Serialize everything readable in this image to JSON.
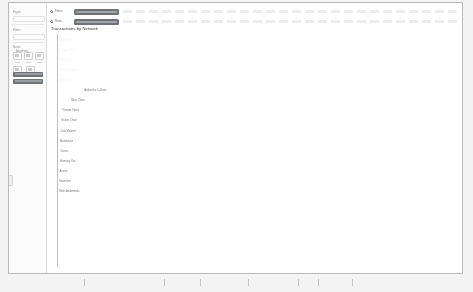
{
  "window": {
    "title": ""
  },
  "sidebar": {
    "section_labels": [
      {
        "text": "Pages",
        "x": 4,
        "y": 8
      },
      {
        "text": "Filters",
        "x": 4,
        "y": 26
      },
      {
        "text": "Marks",
        "x": 4,
        "y": 43
      }
    ],
    "field_label": "Automatic",
    "icon_buttons": [
      {
        "caption": "Color"
      },
      {
        "caption": "Size"
      },
      {
        "caption": "Label"
      },
      {
        "caption": "Detail"
      },
      {
        "caption": "Tooltip"
      }
    ],
    "selected_pills": [
      {
        "label": "SUM(Transactions)"
      },
      {
        "label": "Network Name"
      }
    ]
  },
  "header": {
    "rows": [
      {
        "radio_label": "Filters",
        "pill_label": "SUM(Transactions)"
      },
      {
        "radio_label": "Rows",
        "pill_label": "Network Name"
      }
    ]
  },
  "chart_data": {
    "type": "bar",
    "orientation": "horizontal",
    "title": "Transactions by Network",
    "xlabel": "",
    "ylabel": "",
    "grid": false,
    "legend": "none",
    "xlim": [
      0,
      100
    ],
    "categories": [
      "Ethereum",
      "Polygon POS",
      "BNB Chain",
      "Arbitrum One",
      "Optimism",
      "Avalanche C-Chain",
      "Base Chain",
      "Fantom Opera",
      "Gnosis Chain",
      "Celo Mainnet",
      "Moonbeam",
      "Cronos",
      "Harmony One",
      "Aurora",
      "Moonriver",
      "Metis Andromeda"
    ],
    "values": [
      98,
      72,
      36,
      27,
      20,
      6.5,
      3.2,
      1.0,
      0.7,
      0.5,
      0.4,
      0.35,
      0.3,
      0.25,
      0.2,
      0.15
    ],
    "label_inside_threshold": 18
  },
  "ruler": {
    "tick_positions": [
      84,
      164,
      200,
      248,
      298,
      318,
      352
    ]
  }
}
